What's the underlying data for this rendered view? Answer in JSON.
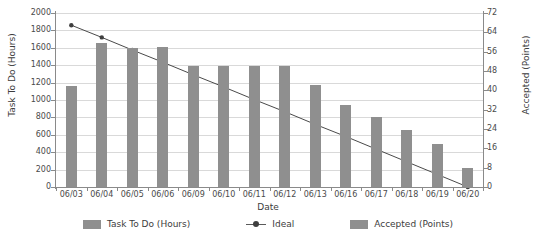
{
  "chart_data": {
    "type": "bar",
    "title": "",
    "subtitle": "",
    "xlabel": "Date",
    "ylabel": "Task To Do (Hours)",
    "y2label": "Accepted (Points)",
    "categories": [
      "06/03",
      "06/04",
      "06/05",
      "06/06",
      "06/09",
      "06/10",
      "06/11",
      "06/12",
      "06/13",
      "06/16",
      "06/17",
      "06/18",
      "06/19",
      "06/20"
    ],
    "ylim": [
      0,
      2000
    ],
    "y2lim": [
      0,
      72
    ],
    "yticks": [
      0,
      200,
      400,
      600,
      800,
      1000,
      1200,
      1400,
      1600,
      1800,
      2000
    ],
    "y2ticks": [
      0,
      8,
      16,
      24,
      32,
      40,
      48,
      56,
      64,
      72
    ],
    "grid": true,
    "legend_position": "bottom",
    "series": [
      {
        "name": "Task To Do (Hours)",
        "kind": "bar",
        "axis": "left",
        "color": "#8f8f8f",
        "values": [
          1160,
          1650,
          1600,
          1610,
          1390,
          1390,
          1390,
          1390,
          1170,
          940,
          800,
          650,
          490,
          220
        ]
      },
      {
        "name": "Ideal",
        "kind": "line",
        "axis": "left",
        "color": "#4a4a4a",
        "values": [
          1860,
          1720,
          1575,
          1435,
          1290,
          1150,
          1005,
          865,
          720,
          580,
          435,
          290,
          145,
          0
        ]
      },
      {
        "name": "Accepted (Points)",
        "kind": "bar",
        "axis": "right",
        "color": "#8f8f8f",
        "values": [
          0,
          0,
          0,
          0,
          0,
          0,
          0,
          0,
          0,
          0,
          0,
          0,
          0,
          0
        ]
      }
    ]
  },
  "axes": {
    "left_title": "Task To Do (Hours)",
    "right_title": "Accepted (Points)",
    "bottom_title": "Date"
  },
  "legend": {
    "items": [
      {
        "label": "Task To Do (Hours)",
        "marker": "square-swatch",
        "color": "#8f8f8f"
      },
      {
        "label": "Ideal",
        "marker": "line-with-dot",
        "color": "#4a4a4a"
      },
      {
        "label": "Accepted (Points)",
        "marker": "square-swatch",
        "color": "#8f8f8f"
      }
    ]
  },
  "colors": {
    "bar": "#8f8f8f",
    "line": "#4a4a4a",
    "grid": "#d9d9d9",
    "axis": "#8a8a8a",
    "text": "#3c3c3c",
    "background": "#ffffff"
  }
}
